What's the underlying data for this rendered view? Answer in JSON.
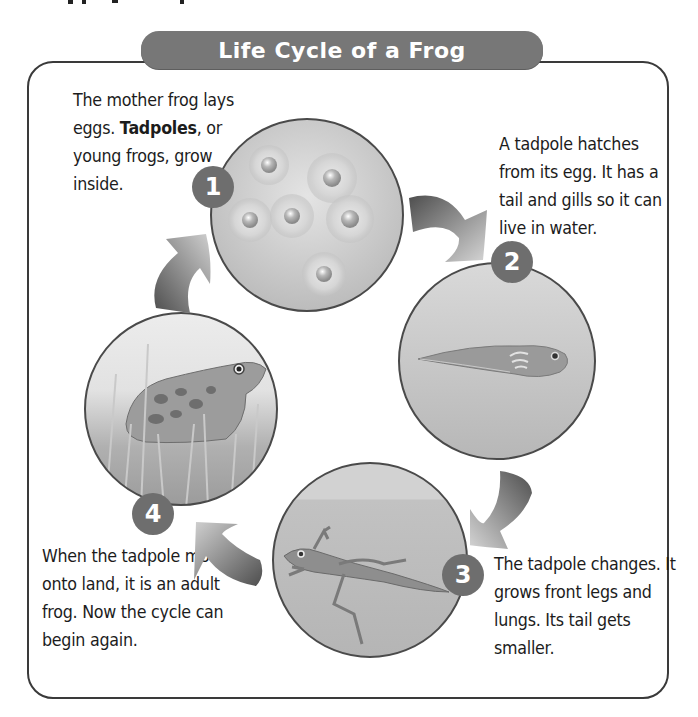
{
  "header": {
    "title": "Life Cycle of a Frog"
  },
  "steps": [
    {
      "number": "1",
      "image": "frog-eggs-illustration",
      "caption_parts": [
        "The mother frog lays eggs. ",
        "Tadpoles",
        ", or young frogs, grow inside."
      ]
    },
    {
      "number": "2",
      "image": "tadpole-illustration",
      "caption": "A tadpole hatches from its egg. It has a tail and gills so it can live in water."
    },
    {
      "number": "3",
      "image": "froglet-illustration",
      "caption": "The tadpole changes. It grows front legs and lungs. Its tail gets smaller."
    },
    {
      "number": "4",
      "image": "adult-frog-illustration",
      "caption": "When the tadpole moves onto land, it is an adult frog. Now the cycle can begin again."
    }
  ],
  "arrows": [
    {
      "from": "1",
      "to": "2",
      "icon": "curved-arrow-icon"
    },
    {
      "from": "2",
      "to": "3",
      "icon": "curved-arrow-icon"
    },
    {
      "from": "3",
      "to": "4",
      "icon": "curved-arrow-icon"
    },
    {
      "from": "4",
      "to": "1",
      "icon": "curved-arrow-icon"
    }
  ],
  "colors": {
    "banner": "#777777",
    "badge": "#6e6e6e",
    "frame": "#3a3a3a",
    "arrow_dark": "#555555",
    "arrow_light": "#c8c8c8"
  }
}
